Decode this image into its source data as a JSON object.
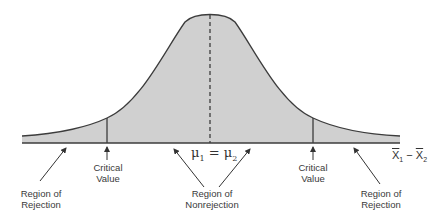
{
  "diagram": {
    "type": "normal-distribution-two-tailed-test",
    "center_label": {
      "mu1": "μ",
      "sub1": "1",
      "eq": " = ",
      "mu2": "μ",
      "sub2": "2"
    },
    "axis_label": {
      "x": "X",
      "sub1": "1",
      "minus": " − ",
      "x2": "X",
      "sub2": "2"
    },
    "critical_left": {
      "line1": "Critical",
      "line2": "Value"
    },
    "critical_right": {
      "line1": "Critical",
      "line2": "Value"
    },
    "rejection_left": {
      "line1": "Region of",
      "line2": "Rejection"
    },
    "rejection_right": {
      "line1": "Region of",
      "line2": "Rejection"
    },
    "nonrejection": {
      "line1": "Region of",
      "line2": "Nonrejection"
    },
    "colors": {
      "fill": "#d0d0d0",
      "stroke": "#3c3c3c"
    }
  }
}
